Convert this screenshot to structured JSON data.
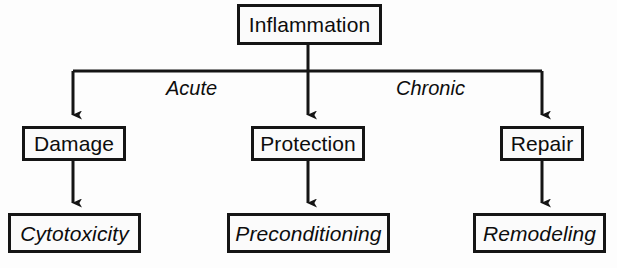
{
  "diagram": {
    "title_text": "Inflammation",
    "background_color": "#fdfdfd",
    "line_color": "#151515",
    "box_fill_color": "#fbfbfb",
    "root": {
      "label": "Inflammation",
      "box": {
        "x": 237,
        "y": 4,
        "w": 145,
        "h": 41
      }
    },
    "branch_labels": [
      {
        "label": "Acute",
        "x": 166,
        "y": 78
      },
      {
        "label": "Chronic",
        "x": 396,
        "y": 78
      }
    ],
    "branches": [
      {
        "pathway": "acute-left",
        "middle": {
          "label": "Damage",
          "box": {
            "x": 22,
            "y": 126,
            "w": 104,
            "h": 35
          }
        },
        "outcome": {
          "label": "Cytotoxicity",
          "box": {
            "x": 8,
            "y": 213,
            "w": 133,
            "h": 40
          }
        },
        "column_x": 73
      },
      {
        "pathway": "center",
        "middle": {
          "label": "Protection",
          "box": {
            "x": 251,
            "y": 126,
            "w": 114,
            "h": 35
          }
        },
        "outcome": {
          "label": "Preconditioning",
          "box": {
            "x": 227,
            "y": 213,
            "w": 163,
            "h": 40
          }
        },
        "column_x": 308
      },
      {
        "pathway": "chronic-right",
        "middle": {
          "label": "Repair",
          "box": {
            "x": 500,
            "y": 126,
            "w": 84,
            "h": 35
          }
        },
        "outcome": {
          "label": "Remodeling",
          "box": {
            "x": 473,
            "y": 213,
            "w": 133,
            "h": 40
          }
        },
        "column_x": 542
      }
    ],
    "bus": {
      "y": 71,
      "x_left": 73,
      "x_right": 542
    }
  }
}
